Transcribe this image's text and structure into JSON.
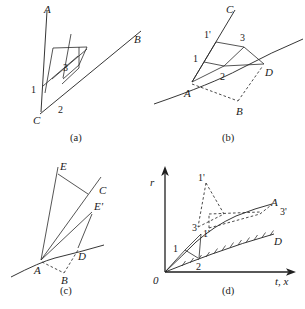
{
  "figure": {
    "panels": [
      {
        "id": "a",
        "caption": "(a)",
        "labels": {
          "A": "A",
          "B": "B",
          "C": "C",
          "n1": "1",
          "n2": "2",
          "n3": "3"
        }
      },
      {
        "id": "b",
        "caption": "(b)",
        "labels": {
          "A": "A",
          "B": "B",
          "C": "C",
          "D": "D",
          "n1": "1",
          "n1p": "1'",
          "n2": "2",
          "n3": "3"
        }
      },
      {
        "id": "c",
        "caption": "(c)",
        "labels": {
          "A": "A",
          "B": "B",
          "C": "C",
          "D": "D",
          "E": "E",
          "Ep": "E'"
        }
      },
      {
        "id": "d",
        "caption": "(d)",
        "labels": {
          "A": "A",
          "D": "D",
          "origin": "0",
          "yaxis": "r",
          "xaxis": "t, x",
          "n1": "1",
          "n2": "2",
          "n3": "3",
          "n1p_upper": "1'",
          "n1p_lower": "1'",
          "n3p": "3'"
        }
      }
    ],
    "bottom_caption": "",
    "colors": {
      "ink": "#1a1a1a",
      "line": "#1f1f1f",
      "dash": "#2a2a2a",
      "background": "#ffffff"
    }
  }
}
